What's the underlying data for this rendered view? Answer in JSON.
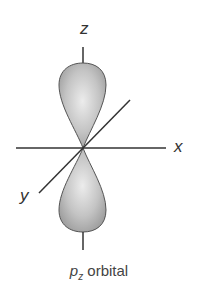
{
  "diagram": {
    "axes": {
      "x_label": "x",
      "y_label": "y",
      "z_label": "z"
    },
    "caption": {
      "main": "p",
      "subscript": "z",
      "suffix": " orbital"
    },
    "colors": {
      "lobe_fill": "#b8b8b8",
      "lobe_highlight": "#e8e8e8",
      "lobe_stroke": "#555555",
      "axis": "#333333"
    }
  }
}
